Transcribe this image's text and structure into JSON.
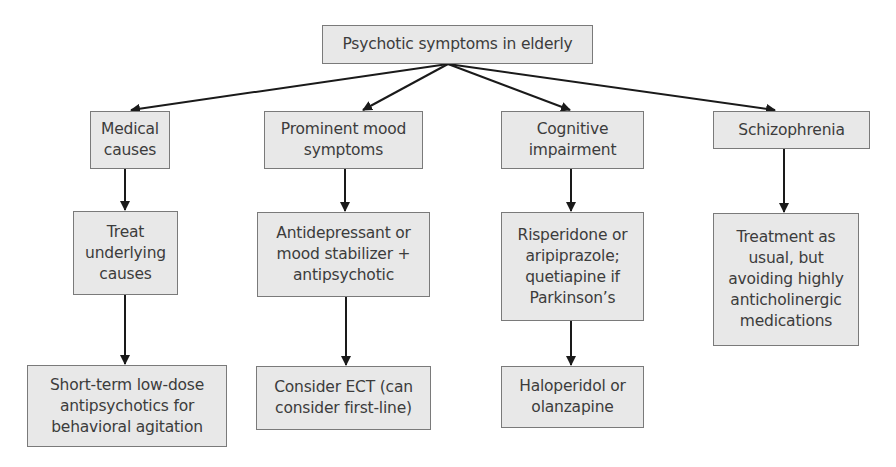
{
  "diagram": {
    "type": "flowchart",
    "colors": {
      "box_fill": "#e8e8e8",
      "box_border": "#7a7a7a",
      "text": "#3c3c3c",
      "arrow": "#1a1a1a"
    },
    "root": {
      "id": "root",
      "label": "Psychotic symptoms in elderly"
    },
    "branches": [
      {
        "id": "medical",
        "label": "Medical\ncauses",
        "steps": [
          {
            "id": "treat-underlying",
            "label": "Treat\nunderlying\ncauses"
          },
          {
            "id": "short-term",
            "label": "Short-term low-dose\nantipsychotics for\nbehavioral agitation"
          }
        ]
      },
      {
        "id": "mood",
        "label": "Prominent mood\nsymptoms",
        "steps": [
          {
            "id": "antidepressant",
            "label": "Antidepressant or\nmood stabilizer +\nantipsychotic"
          },
          {
            "id": "ect",
            "label": "Consider ECT (can\nconsider first-line)"
          }
        ]
      },
      {
        "id": "cognitive",
        "label": "Cognitive\nimpairment",
        "steps": [
          {
            "id": "risperidone",
            "label": "Risperidone or\naripiprazole;\nquetiapine if\nParkinson’s"
          },
          {
            "id": "haloperidol",
            "label": "Haloperidol or\nolanzapine"
          }
        ]
      },
      {
        "id": "schizophrenia",
        "label": "Schizophrenia",
        "steps": [
          {
            "id": "treatment-usual",
            "label": "Treatment as\nusual, but\navoiding highly\nanticholinergic\nmedications"
          }
        ]
      }
    ],
    "edges": [
      [
        "root",
        "medical"
      ],
      [
        "root",
        "mood"
      ],
      [
        "root",
        "cognitive"
      ],
      [
        "root",
        "schizophrenia"
      ],
      [
        "medical",
        "treat-underlying"
      ],
      [
        "treat-underlying",
        "short-term"
      ],
      [
        "mood",
        "antidepressant"
      ],
      [
        "antidepressant",
        "ect"
      ],
      [
        "cognitive",
        "risperidone"
      ],
      [
        "risperidone",
        "haloperidol"
      ],
      [
        "schizophrenia",
        "treatment-usual"
      ]
    ]
  }
}
